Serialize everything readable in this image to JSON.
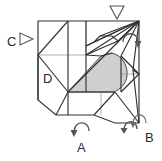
{
  "diagram": {
    "type": "origami-folding-step",
    "title": "",
    "width": 162,
    "height": 161,
    "background_color": "#ffffff",
    "line_color": "#333333",
    "thin_line_color": "#888888",
    "shaded_region_fill": "#cfcfcf",
    "shaded_region_stroke": "#4a4a4a",
    "labels": [
      {
        "id": "A",
        "text": "A",
        "x": 77,
        "y": 141,
        "role": "fold-reference-bottom"
      },
      {
        "id": "B",
        "text": "B",
        "x": 145,
        "y": 131,
        "role": "fold-reference-bottom-right"
      },
      {
        "id": "C",
        "text": "C",
        "x": 7,
        "y": 35,
        "role": "fold-reference-left"
      },
      {
        "id": "D",
        "text": "D",
        "x": 43,
        "y": 72,
        "role": "fold-reference-inner-left"
      }
    ],
    "arrows": [
      {
        "id": "arrow-top-down",
        "kind": "hollow-triangle",
        "direction": "down",
        "x": 117,
        "y": 10
      },
      {
        "id": "arrow-left-right",
        "kind": "hollow-triangle",
        "direction": "right",
        "x": 23,
        "y": 38
      },
      {
        "id": "arrow-rotate-right",
        "kind": "curved-solid",
        "direction": "down",
        "x": 131,
        "y": 38
      },
      {
        "id": "arrow-rotate-bottom",
        "kind": "curved-solid",
        "direction": "down",
        "x": 80,
        "y": 127
      },
      {
        "id": "arrow-rotate-b1",
        "kind": "curved-solid",
        "direction": "down",
        "x": 128,
        "y": 126
      },
      {
        "id": "arrow-rotate-b2",
        "kind": "curved-solid",
        "direction": "down",
        "x": 140,
        "y": 122
      }
    ]
  }
}
